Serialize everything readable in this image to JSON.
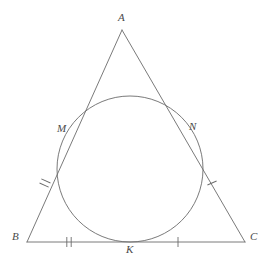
{
  "figure": {
    "kind": "geometry-diagram",
    "width": 271,
    "height": 265,
    "background_color": "#ffffff",
    "stroke_color": "#6b6b6b",
    "label_color": "#4a4a4a",
    "stroke_width": 0.9
  },
  "points": {
    "A": {
      "label": "A",
      "x": 122,
      "y": 30,
      "label_x": 118,
      "label_y": 12
    },
    "B": {
      "label": "B",
      "x": 27,
      "y": 242,
      "label_x": 12,
      "label_y": 231
    },
    "C": {
      "label": "C",
      "x": 245,
      "y": 242,
      "label_x": 250,
      "label_y": 231
    },
    "M": {
      "label": "M",
      "x": 70,
      "y": 133,
      "label_x": 57,
      "label_y": 123
    },
    "N": {
      "label": "N",
      "x": 188,
      "y": 133,
      "label_x": 189,
      "label_y": 121
    },
    "K": {
      "label": "K",
      "x": 130,
      "y": 242,
      "label_x": 126,
      "label_y": 244
    }
  },
  "circle": {
    "name": "inscribed-circle",
    "cx": 130,
    "cy": 169,
    "r": 73
  },
  "segments": [
    {
      "name": "side-ab",
      "from": "A",
      "to": "B"
    },
    {
      "name": "side-ac",
      "from": "A",
      "to": "C"
    },
    {
      "name": "base-bc",
      "from": "B",
      "to": "C"
    }
  ],
  "tick_marks": [
    {
      "name": "tick-bm-double",
      "segment": "side-ab",
      "count": 2,
      "x": 45,
      "y": 183,
      "angle": -66
    },
    {
      "name": "tick-nc-single",
      "segment": "side-ac",
      "count": 1,
      "x": 212,
      "y": 183,
      "angle": 66
    },
    {
      "name": "tick-bk-double",
      "segment": "base-bc",
      "count": 2,
      "x": 69,
      "y": 242,
      "angle": 0
    },
    {
      "name": "tick-kc-single",
      "segment": "base-bc",
      "count": 1,
      "x": 178,
      "y": 242,
      "angle": 0
    }
  ]
}
